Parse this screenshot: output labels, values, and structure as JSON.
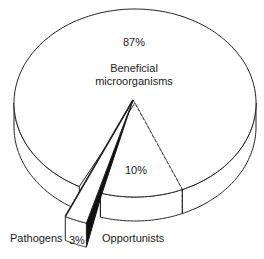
{
  "chart_data": {
    "type": "pie",
    "style": "3d-exploded",
    "title": "",
    "slices": [
      {
        "label": "Beneficial microorganisms",
        "value": 87,
        "display": "87%"
      },
      {
        "label": "Opportunists",
        "value": 10,
        "display": "10%"
      },
      {
        "label": "Pathogens",
        "value": 3,
        "display": "3%",
        "exploded": true
      }
    ],
    "legend": "none",
    "colors": {
      "fill": "#ffffff",
      "stroke": "#222222",
      "shadow": "#111111"
    }
  },
  "labels": {
    "beneficial_pct": "87%",
    "beneficial_name_line1": "Beneficial",
    "beneficial_name_line2": "microorganisms",
    "opportunists_pct": "10%",
    "opportunists_name": "Opportunists",
    "pathogens_pct": "3%",
    "pathogens_name": "Pathogens"
  }
}
